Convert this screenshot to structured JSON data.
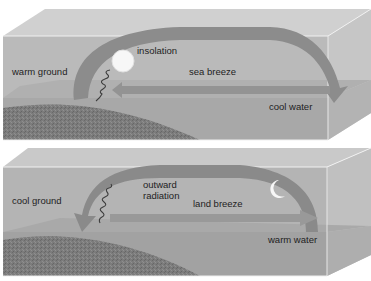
{
  "diagram": {
    "panels": [
      {
        "name": "day-sea-breeze",
        "labels": {
          "land": "warm ground",
          "energy": "insolation",
          "wind": "sea breeze",
          "water": "cool water"
        },
        "celestial_icon": "sun-icon"
      },
      {
        "name": "night-land-breeze",
        "labels": {
          "land": "cool ground",
          "energy_line1": "outward",
          "energy_line2": "radiation",
          "wind": "land breeze",
          "water": "warm water"
        },
        "celestial_icon": "moon-icon"
      }
    ],
    "colors": {
      "box_front": "#b9b9b9",
      "box_top": "#cfcfcf",
      "box_side": "#c4c4c4",
      "water": "#a9a9a9",
      "ground": "#7a7a7a",
      "arrow": "#8a8a8a",
      "edge": "#f2f2f2"
    }
  }
}
